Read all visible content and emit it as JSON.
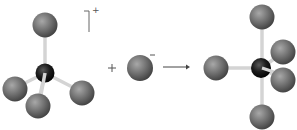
{
  "diagram": {
    "type": "chemical-reaction",
    "reactant_cation": {
      "geometry": "tetrahedral",
      "central_atom_color": "#1a1a1a",
      "ligand_color": "#6b6b6b",
      "ligand_count": 4,
      "charge": "+"
    },
    "plus_sign": "+",
    "reactant_anion": {
      "atom_color": "#6b6b6b",
      "charge": "−"
    },
    "arrow": "→",
    "product": {
      "geometry": "trigonal-bipyramidal",
      "central_atom_color": "#1a1a1a",
      "ligand_color": "#6b6b6b",
      "ligand_count": 5
    },
    "bond_color": "#cfcfcf"
  }
}
